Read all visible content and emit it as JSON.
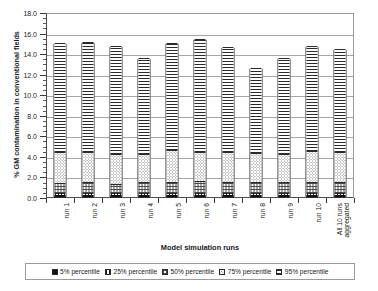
{
  "chart_data": {
    "type": "bar",
    "stacked": true,
    "title": "",
    "xlabel": "Model simulation runs",
    "ylabel": "% GM contamination in conventional fields",
    "ylim": [
      0.0,
      18.0
    ],
    "ytick_step": 2.0,
    "ytick_labels": [
      "0.0",
      "2.0",
      "4.0",
      "6.0",
      "8.0",
      "10.0",
      "12.0",
      "14.0",
      "16.0",
      "18.0"
    ],
    "ytick_values": [
      0.0,
      2.0,
      4.0,
      6.0,
      8.0,
      10.0,
      12.0,
      14.0,
      16.0,
      18.0
    ],
    "grid": true,
    "grid_axis": "y",
    "legend_position": "bottom",
    "categories": [
      "run 1",
      "run 2",
      "run 3",
      "run 4",
      "run 5",
      "run 6",
      "run 7",
      "run 8",
      "run 9",
      "run 10",
      "All 10 runs aggregated"
    ],
    "category_lines": [
      [
        "run 1"
      ],
      [
        "run 2"
      ],
      [
        "run 3"
      ],
      [
        "run 4"
      ],
      [
        "run 5"
      ],
      [
        "run 6"
      ],
      [
        "run 7"
      ],
      [
        "run 8"
      ],
      [
        "run 9"
      ],
      [
        "run 10"
      ],
      [
        "All 10 runs",
        "aggregated"
      ]
    ],
    "series": [
      {
        "name": "5% percentile",
        "pattern": "solid-black",
        "values": [
          0.15,
          0.15,
          0.15,
          0.15,
          0.15,
          0.15,
          0.15,
          0.15,
          0.15,
          0.15,
          0.15
        ]
      },
      {
        "name": "25% percentile",
        "pattern": "vertical-stripes",
        "values": [
          0.2,
          0.2,
          0.2,
          0.2,
          0.25,
          0.2,
          0.2,
          0.2,
          0.2,
          0.2,
          0.2
        ]
      },
      {
        "name": "50% percentile",
        "pattern": "crosshatch",
        "values": [
          1.05,
          1.1,
          0.95,
          1.15,
          1.1,
          1.25,
          1.1,
          1.1,
          1.1,
          1.15,
          1.1
        ]
      },
      {
        "name": "75% percentile",
        "pattern": "fine-dots",
        "values": [
          3.0,
          2.95,
          2.9,
          2.7,
          3.1,
          2.8,
          2.9,
          2.85,
          2.75,
          3.0,
          2.95
        ]
      },
      {
        "name": "95% percentile",
        "pattern": "horizontal-stripes",
        "values": [
          10.6,
          10.7,
          10.45,
          9.3,
          10.4,
          10.95,
          10.25,
          8.25,
          9.35,
          10.2,
          10.0
        ]
      }
    ],
    "totals": [
      15.0,
      15.1,
      14.65,
      13.5,
      15.0,
      15.35,
      14.6,
      12.55,
      13.55,
      14.7,
      14.4
    ],
    "cumulative_tops": [
      {
        "category": "run 1",
        "p5": 0.15,
        "p25": 0.35,
        "p50": 1.4,
        "p75": 4.4,
        "p95": 15.0
      },
      {
        "category": "run 2",
        "p5": 0.15,
        "p25": 0.35,
        "p50": 1.45,
        "p75": 4.4,
        "p95": 15.1
      },
      {
        "category": "run 3",
        "p5": 0.15,
        "p25": 0.35,
        "p50": 1.3,
        "p75": 4.2,
        "p95": 14.65
      },
      {
        "category": "run 4",
        "p5": 0.15,
        "p25": 0.35,
        "p50": 1.5,
        "p75": 4.2,
        "p95": 13.5
      },
      {
        "category": "run 5",
        "p5": 0.15,
        "p25": 0.4,
        "p50": 1.5,
        "p75": 4.6,
        "p95": 15.0
      },
      {
        "category": "run 6",
        "p5": 0.15,
        "p25": 0.35,
        "p50": 1.6,
        "p75": 4.4,
        "p95": 15.35
      },
      {
        "category": "run 7",
        "p5": 0.15,
        "p25": 0.35,
        "p50": 1.45,
        "p75": 4.35,
        "p95": 14.6
      },
      {
        "category": "run 8",
        "p5": 0.15,
        "p25": 0.35,
        "p50": 1.45,
        "p75": 4.3,
        "p95": 12.55
      },
      {
        "category": "run 9",
        "p5": 0.15,
        "p25": 0.35,
        "p50": 1.45,
        "p75": 4.2,
        "p95": 13.55
      },
      {
        "category": "run 10",
        "p5": 0.15,
        "p25": 0.35,
        "p50": 1.5,
        "p75": 4.5,
        "p95": 14.7
      },
      {
        "category": "All 10 runs aggregated",
        "p5": 0.15,
        "p25": 0.35,
        "p50": 1.45,
        "p75": 4.4,
        "p95": 14.4
      }
    ],
    "legend": [
      {
        "label": "5% percentile",
        "pattern": "solid-black"
      },
      {
        "label": "25% percentile",
        "pattern": "vertical-stripes"
      },
      {
        "label": "50% percentile",
        "pattern": "crosshatch"
      },
      {
        "label": "75% percentile",
        "pattern": "fine-dots"
      },
      {
        "label": "95% percentile",
        "pattern": "horizontal-stripes"
      }
    ],
    "colors": {
      "p5": "#121212",
      "p25": "#1f1f1f",
      "p50": "#4a4a4a",
      "p75": "#8d8d8d",
      "p95": "#2a2a2a",
      "axis": "#3a3a3a",
      "grid": "#a6a6a6",
      "background": "#ffffff"
    }
  }
}
